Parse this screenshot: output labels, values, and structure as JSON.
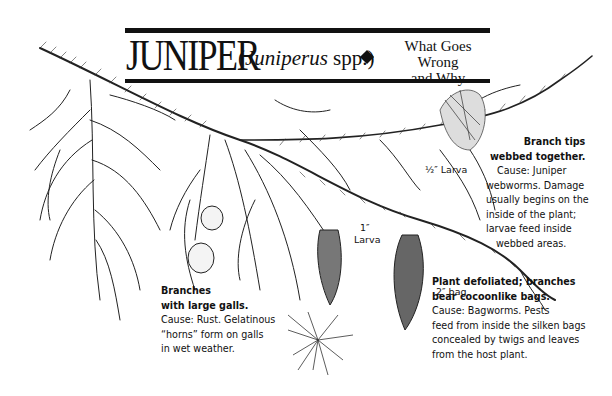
{
  "title": {
    "common_name": "JUNIPER",
    "open_paren": "(",
    "scientific_name": "Juniperus",
    "spp": " spp.)",
    "subtitle_line1": "What Goes Wrong",
    "subtitle_line2": "and Why"
  },
  "callouts": {
    "webworm": {
      "heading_line1": "Branch tips",
      "heading_line2": "webbed together.",
      "body": [
        "Cause: Juniper",
        "webworms. Damage",
        "usually begins on the",
        "inside of the plant;",
        "larvae feed inside",
        "webbed areas."
      ]
    },
    "rust": {
      "heading_line1": "Branches",
      "heading_line2": "with large galls.",
      "body": [
        "Cause: Rust. Gelatinous",
        "“horns” form on galls",
        "in wet weather."
      ]
    },
    "bagworm": {
      "heading_line1": "Plant defoliated; branches",
      "heading_line2": "bear cocoonlike bags.",
      "body": [
        "Cause: Bagworms. Pests",
        "feed from inside the silken bags",
        "concealed by twigs and leaves",
        "from the host plant."
      ]
    }
  },
  "labels": {
    "half_inch_larva": "½″ Larva",
    "one_inch": "1″",
    "larva": "Larva",
    "two_inch_bag": "2″ bag"
  },
  "colors": {
    "ink": "#111111",
    "background": "#ffffff"
  }
}
